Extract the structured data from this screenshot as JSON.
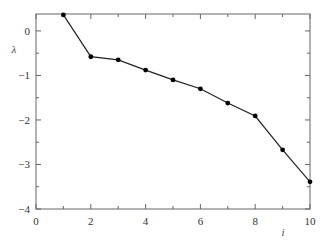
{
  "chart_data": {
    "type": "line",
    "title": "",
    "xlabel": "i",
    "ylabel": "λ",
    "xlim": [
      0,
      10
    ],
    "ylim": [
      -4,
      0.38
    ],
    "xticks": [
      0,
      2,
      4,
      6,
      8,
      10
    ],
    "xticks_minor": [
      1,
      3,
      5,
      7,
      9
    ],
    "yticks": [
      0,
      -1,
      -2,
      -3,
      -4
    ],
    "yticks_minor": [
      -0.5,
      -1.5,
      -2.5,
      -3.5
    ],
    "grid": false,
    "legend": null,
    "marker": "filled-circle",
    "line_color": "#222222",
    "series": [
      {
        "name": "λ",
        "x": [
          1,
          2,
          3,
          4,
          5,
          6,
          7,
          8,
          9,
          10
        ],
        "values": [
          0.36,
          -0.58,
          -0.65,
          -0.88,
          -1.1,
          -1.3,
          -1.62,
          -1.91,
          -2.67,
          -3.39
        ]
      }
    ]
  },
  "labels": {
    "x_axis": "i",
    "y_axis": "λ"
  }
}
